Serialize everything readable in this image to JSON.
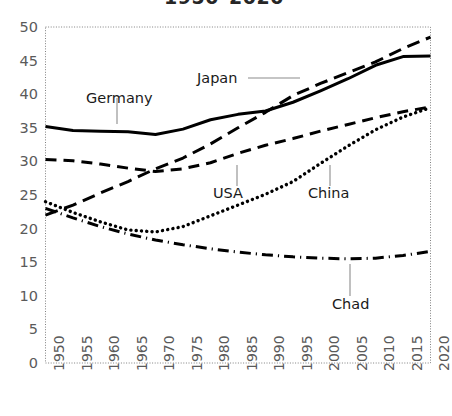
{
  "chart_data": {
    "type": "line",
    "title": "1950–2020",
    "xlabel": "",
    "ylabel": "",
    "xlim": [
      1950,
      2020
    ],
    "ylim": [
      0,
      50
    ],
    "grid": false,
    "legend_position": "inline-annotations",
    "x": [
      1950,
      1955,
      1960,
      1965,
      1970,
      1975,
      1980,
      1985,
      1990,
      1995,
      2000,
      2005,
      2010,
      2015,
      2020
    ],
    "categories": [
      "1950",
      "1955",
      "1960",
      "1965",
      "1970",
      "1975",
      "1980",
      "1985",
      "1990",
      "1995",
      "2000",
      "2005",
      "2010",
      "2015",
      "2020"
    ],
    "ytick_labels": [
      "0",
      "5",
      "10",
      "15",
      "20",
      "25",
      "30",
      "35",
      "40",
      "45",
      "50"
    ],
    "ytick_values": [
      0,
      5,
      10,
      15,
      20,
      25,
      30,
      35,
      40,
      45,
      50
    ],
    "series": [
      {
        "name": "Germany",
        "style": "solid",
        "values": [
          35.2,
          34.6,
          34.5,
          34.4,
          34.0,
          34.8,
          36.2,
          37.0,
          37.5,
          38.8,
          40.5,
          42.3,
          44.3,
          45.6,
          45.7
        ]
      },
      {
        "name": "Japan",
        "style": "dashed-long",
        "values": [
          22.0,
          23.5,
          25.3,
          27.0,
          28.9,
          30.5,
          32.6,
          35.0,
          37.3,
          39.8,
          41.6,
          43.2,
          44.8,
          46.8,
          48.5
        ]
      },
      {
        "name": "USA",
        "style": "dashed",
        "values": [
          30.3,
          30.1,
          29.6,
          29.0,
          28.5,
          28.9,
          29.8,
          31.2,
          32.4,
          33.4,
          34.5,
          35.5,
          36.5,
          37.4,
          38.1
        ]
      },
      {
        "name": "China",
        "style": "dotted",
        "values": [
          24.0,
          22.4,
          21.0,
          19.8,
          19.5,
          20.3,
          21.9,
          23.5,
          25.1,
          27.0,
          29.7,
          32.3,
          34.7,
          36.6,
          38.0
        ]
      },
      {
        "name": "Chad",
        "style": "dash-dot",
        "values": [
          23.0,
          21.6,
          20.3,
          19.2,
          18.3,
          17.6,
          17.0,
          16.5,
          16.1,
          15.8,
          15.6,
          15.5,
          15.6,
          16.0,
          16.6
        ]
      }
    ],
    "annotations": [
      {
        "text": "Germany",
        "series": "Germany"
      },
      {
        "text": "Japan",
        "series": "Japan"
      },
      {
        "text": "USA",
        "series": "USA"
      },
      {
        "text": "China",
        "series": "China"
      },
      {
        "text": "Chad",
        "series": "Chad"
      }
    ],
    "colors": {
      "line": "#000000",
      "axis": "#808080",
      "tick_text": "#5a5a5a",
      "title_text": "#262626",
      "background": "#ffffff"
    }
  }
}
